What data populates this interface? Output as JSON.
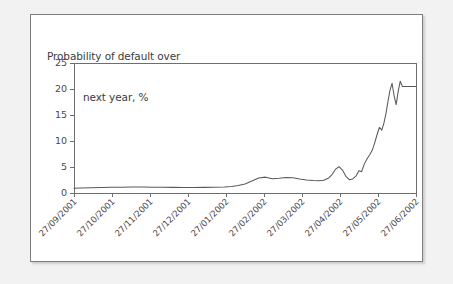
{
  "figure": {
    "title_line_1": "Probability of default over",
    "title_line_2": "next year, %",
    "panel_background": "#ffffff",
    "outer_background": "#f2f2f2",
    "border_color": "#7d7d7d"
  },
  "chart_data": {
    "type": "line",
    "title": "Probability of default over next year, %",
    "xlabel": "",
    "ylabel": "",
    "ylim": [
      0,
      25
    ],
    "yticks": [
      0,
      5,
      10,
      15,
      20,
      25
    ],
    "grid": false,
    "legend": false,
    "line_color": "#595959",
    "categories": [
      "27/09/2001",
      "27/10/2001",
      "27/11/2001",
      "27/12/2001",
      "27/01/2002",
      "27/02/2002",
      "27/03/2002",
      "27/04/2002",
      "27/05/2002",
      "27/06/2002"
    ],
    "series": [
      {
        "name": "Probability of default over next year, %",
        "x": [
          0.0,
          0.02,
          0.05,
          0.08,
          0.11,
          0.14,
          0.17,
          0.2,
          0.23,
          0.26,
          0.29,
          0.32,
          0.35,
          0.38,
          0.41,
          0.44,
          0.46,
          0.48,
          0.5,
          0.52,
          0.54,
          0.56,
          0.58,
          0.6,
          0.62,
          0.64,
          0.66,
          0.68,
          0.7,
          0.715,
          0.73,
          0.745,
          0.755,
          0.765,
          0.775,
          0.785,
          0.795,
          0.805,
          0.815,
          0.825,
          0.833,
          0.841,
          0.849,
          0.857,
          0.865,
          0.872,
          0.879,
          0.886,
          0.893,
          0.9,
          0.906,
          0.912,
          0.918,
          0.924,
          0.93,
          0.936,
          0.942,
          0.948,
          0.954,
          0.96,
          1.0
        ],
        "values": [
          0.9,
          0.95,
          1.0,
          1.05,
          1.1,
          1.12,
          1.15,
          1.15,
          1.12,
          1.1,
          1.08,
          1.05,
          1.05,
          1.08,
          1.1,
          1.15,
          1.25,
          1.45,
          1.75,
          2.3,
          2.9,
          3.05,
          2.75,
          2.85,
          3.0,
          2.95,
          2.7,
          2.5,
          2.4,
          2.35,
          2.45,
          2.9,
          3.6,
          4.6,
          5.05,
          4.4,
          3.2,
          2.55,
          2.7,
          3.3,
          4.3,
          4.1,
          5.6,
          6.6,
          7.4,
          8.2,
          9.6,
          11.2,
          12.6,
          12.1,
          13.4,
          15.2,
          17.6,
          19.8,
          21.1,
          18.7,
          17.0,
          19.6,
          21.5,
          20.5,
          20.5
        ]
      }
    ],
    "annotations": []
  },
  "axis": {
    "y_tick_labels": [
      "25",
      "20",
      "15",
      "10",
      "5",
      "0"
    ],
    "x_tick_labels": [
      "27/09/2001",
      "27/10/2001",
      "27/11/2001",
      "27/12/2001",
      "27/01/2002",
      "27/02/2002",
      "27/03/2002",
      "27/04/2002",
      "27/05/2002",
      "27/06/2002"
    ]
  }
}
